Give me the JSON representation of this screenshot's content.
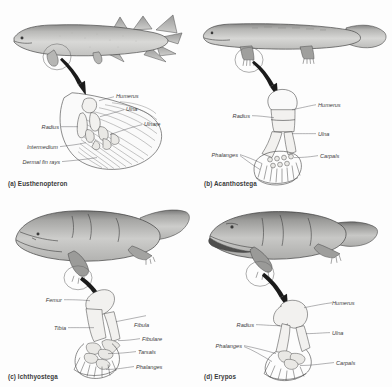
{
  "figure": {
    "background_color": "#fdfdfd",
    "body_fill_light": "#d8d8d6",
    "body_fill_dark": "#8d8d8c",
    "bone_fill": "#f2f1ef",
    "line_color": "#3f3f3f",
    "label_color": "#3c3c3c"
  },
  "panels": [
    {
      "id": "a",
      "caption": "(a) Eusthenopteron",
      "taxon": "Eusthenopteron",
      "animal": "lobe-finned-fish",
      "limb_type": "pectoral fin skeleton",
      "labels": [
        {
          "name": "Humerus",
          "side": "right"
        },
        {
          "name": "Ulna",
          "side": "right"
        },
        {
          "name": "Ulnare",
          "side": "right"
        },
        {
          "name": "Radius",
          "side": "left"
        },
        {
          "name": "Intermedium",
          "side": "left"
        },
        {
          "name": "Dermal fin rays",
          "side": "left"
        }
      ]
    },
    {
      "id": "b",
      "caption": "(b) Acanthostega",
      "taxon": "Acanthostega",
      "animal": "early-tetrapod",
      "limb_type": "forelimb skeleton",
      "labels": [
        {
          "name": "Humerus",
          "side": "right"
        },
        {
          "name": "Ulna",
          "side": "right"
        },
        {
          "name": "Carpals",
          "side": "right"
        },
        {
          "name": "Radius",
          "side": "left"
        },
        {
          "name": "Phalanges",
          "side": "left"
        }
      ]
    },
    {
      "id": "c",
      "caption": "(c) Ichthyostega",
      "taxon": "Ichthyostega",
      "animal": "early-tetrapod",
      "limb_type": "hind limb skeleton",
      "labels": [
        {
          "name": "Femur",
          "side": "left"
        },
        {
          "name": "Tibia",
          "side": "left"
        },
        {
          "name": "Fibula",
          "side": "right"
        },
        {
          "name": "Fibulare",
          "side": "right"
        },
        {
          "name": "Tarsals",
          "side": "right"
        },
        {
          "name": "Phalanges",
          "side": "right"
        }
      ]
    },
    {
      "id": "d",
      "caption": "(d) Erypos",
      "taxon": "Erypos",
      "animal": "temnospondyl-amphibian",
      "limb_type": "forelimb skeleton",
      "labels": [
        {
          "name": "Humerus",
          "side": "right"
        },
        {
          "name": "Ulna",
          "side": "right"
        },
        {
          "name": "Carpals",
          "side": "right"
        },
        {
          "name": "Radius",
          "side": "left"
        },
        {
          "name": "Phalanges",
          "side": "left"
        }
      ]
    }
  ]
}
